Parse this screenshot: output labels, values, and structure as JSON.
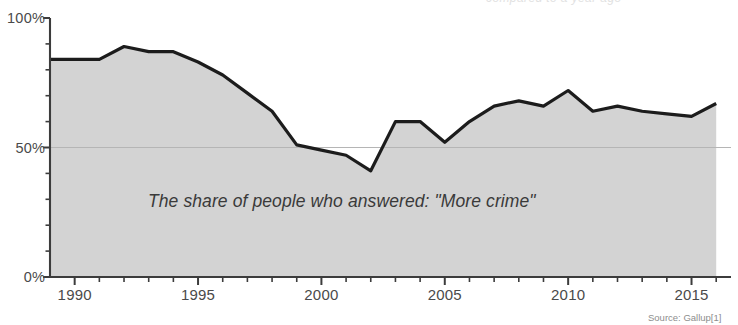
{
  "chart_data": {
    "type": "area",
    "title": "",
    "subtitle": "",
    "annotation": "The share of people who answered: \"More crime\"",
    "source": "Source: Gallup[1]",
    "top_clipped_text": "compared to a year ago",
    "xlabel": "",
    "ylabel": "",
    "xlim": [
      1989,
      2016.6
    ],
    "ylim": [
      0,
      100
    ],
    "grid": "horizontal-50-only",
    "legend_position": "none",
    "y_ticks": [
      {
        "value": 0,
        "label": "0%"
      },
      {
        "value": 50,
        "label": "50%"
      },
      {
        "value": 100,
        "label": "100%"
      }
    ],
    "y_minor_ticks": [
      10,
      20,
      30,
      40,
      60,
      70,
      80,
      90
    ],
    "x_ticks": [
      {
        "value": 1990,
        "label": "1990"
      },
      {
        "value": 1995,
        "label": "1995"
      },
      {
        "value": 2000,
        "label": "2000"
      },
      {
        "value": 2005,
        "label": "2005"
      },
      {
        "value": 2010,
        "label": "2010"
      },
      {
        "value": 2015,
        "label": "2015"
      }
    ],
    "x_minor_ticks": [
      1991,
      1992,
      1993,
      1994,
      1996,
      1997,
      1998,
      1999,
      2001,
      2002,
      2003,
      2004,
      2006,
      2007,
      2008,
      2009,
      2011,
      2012,
      2013,
      2014,
      2016
    ],
    "series": [
      {
        "name": "More crime",
        "x": [
          1989,
          1990,
          1991,
          1992,
          1993,
          1994,
          1995,
          1996,
          1997,
          1998,
          1999,
          2000,
          2001,
          2002,
          2003,
          2004,
          2005,
          2006,
          2007,
          2008,
          2009,
          2010,
          2011,
          2012,
          2013,
          2014,
          2015,
          2016
        ],
        "values": [
          84,
          84,
          84,
          89,
          87,
          87,
          83,
          78,
          71,
          64,
          51,
          49,
          47,
          41,
          60,
          60,
          52,
          60,
          66,
          68,
          66,
          72,
          64,
          66,
          64,
          63,
          62,
          67
        ]
      }
    ],
    "colors": {
      "line": "#1c1c1c",
      "area_fill": "#d3d3d3",
      "axis": "#3c3c3c",
      "gridline": "#b5b5b5",
      "tick_label": "#4a4a4a",
      "annotation": "#3a3a3a",
      "source": "#8d8d8d",
      "background": "#ffffff"
    }
  }
}
